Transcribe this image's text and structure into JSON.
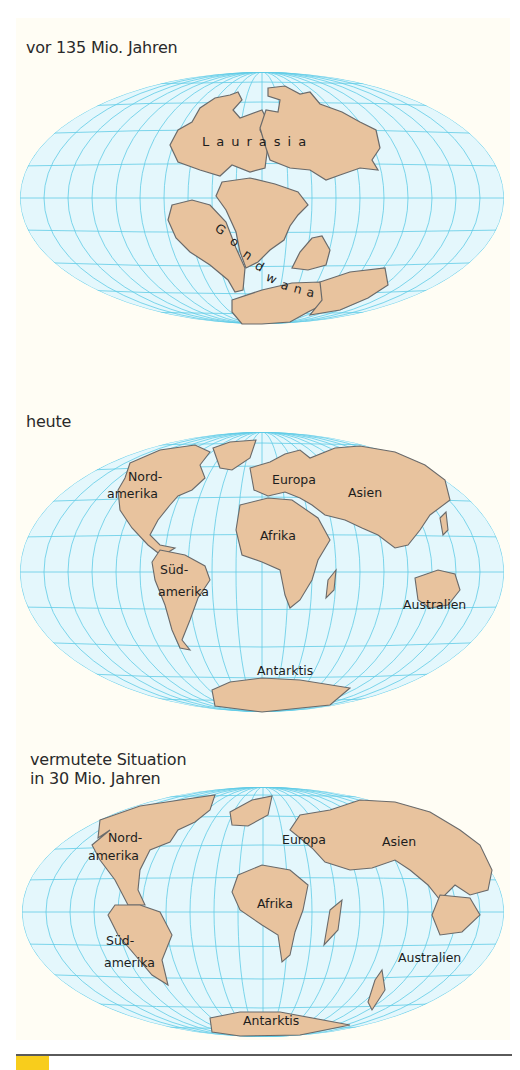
{
  "colors": {
    "page_bg": "#fffdf4",
    "ocean": "#e4f7fc",
    "grid": "#5fcbe6",
    "land": "#e8c39e",
    "coast": "#6a6a6a",
    "accent_tag": "#f8cd1c"
  },
  "maps": [
    {
      "caption": "vor 135 Mio. Jahren",
      "labels": {
        "laurasia": "Laurasia",
        "gondwana": "Gondwana"
      }
    },
    {
      "caption": "heute",
      "labels": {
        "nordamerika_1": "Nord-",
        "nordamerika_2": "amerika",
        "suedamerika_1": "Süd-",
        "suedamerika_2": "amerika",
        "europa": "Europa",
        "asien": "Asien",
        "afrika": "Afrika",
        "australien": "Australien",
        "antarktis": "Antarktis"
      }
    },
    {
      "caption_line1": "vermutete Situation",
      "caption_line2": "in 30 Mio. Jahren",
      "labels": {
        "nordamerika_1": "Nord-",
        "nordamerika_2": "amerika",
        "suedamerika_1": "Süd-",
        "suedamerika_2": "amerika",
        "europa": "Europa",
        "asien": "Asien",
        "afrika": "Afrika",
        "australien": "Australien",
        "antarktis": "Antarktis"
      }
    }
  ]
}
